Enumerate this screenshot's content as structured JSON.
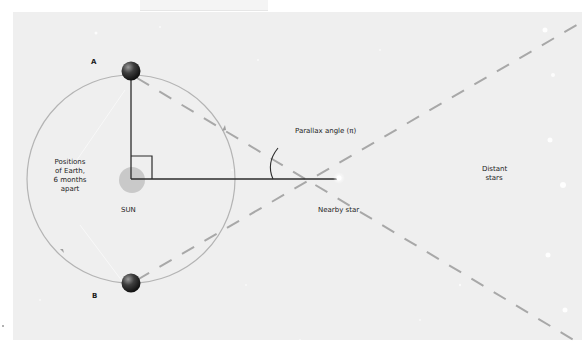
{
  "diagram": {
    "labels": {
      "position_a": "A",
      "position_b": "B",
      "earth_positions": [
        "Positions",
        "of Earth,",
        "6 months",
        "apart"
      ],
      "sun": "SUN",
      "parallax_angle": "Parallax angle (π)",
      "nearby_star": "Nearby star",
      "distant_stars": [
        "Distant",
        "stars"
      ]
    },
    "colors": {
      "background": "#efefef",
      "orbit": "#b4b4b4",
      "sun": "#c9c9c9",
      "baseline": "#2b2b2b",
      "dashed_lines": "#a8a8a8",
      "earth": "#3a3a3a"
    }
  }
}
